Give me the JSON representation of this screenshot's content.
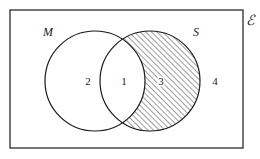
{
  "diagram": {
    "kind": "venn-diagram",
    "universe": {
      "label": "ℰ",
      "label_name": "universal-set-symbol",
      "rect": {
        "x": 10,
        "y": 10,
        "width": 233,
        "height": 138
      },
      "stroke": "#1a1a1a",
      "stroke_width": 1.2,
      "fill": "#ffffff"
    },
    "sets": [
      {
        "id": "M",
        "label": "M",
        "cx": 95,
        "cy": 81,
        "r": 50,
        "label_x": 48,
        "label_y": 36,
        "stroke": "#1a1a1a",
        "stroke_width": 1.2,
        "fill": "#ffffff"
      },
      {
        "id": "S",
        "label": "S",
        "cx": 150,
        "cy": 81,
        "r": 50,
        "label_x": 196,
        "label_y": 36,
        "stroke": "#1a1a1a",
        "stroke_width": 1.2,
        "fill": "none"
      }
    ],
    "shading": {
      "region": "S-minus-M",
      "description": "The portion of set S lying outside set M is hatched",
      "pattern": "diagonal-hatch",
      "angle_degrees": 45,
      "spacing_px": 4,
      "line_color": "#1a1a1a",
      "line_width": 0.8,
      "background": "#ffffff"
    },
    "regions": [
      {
        "id": "region-2",
        "number": "2",
        "meaning": "M only",
        "x": 88,
        "y": 85,
        "shaded": false,
        "halo": false
      },
      {
        "id": "region-1",
        "number": "1",
        "meaning": "M and S",
        "x": 124,
        "y": 85,
        "shaded": false,
        "halo": false
      },
      {
        "id": "region-3",
        "number": "3",
        "meaning": "S only",
        "x": 161,
        "y": 85,
        "shaded": true,
        "halo": true
      },
      {
        "id": "region-4",
        "number": "4",
        "meaning": "outside M and S",
        "x": 215,
        "y": 85,
        "shaded": false,
        "halo": false
      }
    ]
  }
}
